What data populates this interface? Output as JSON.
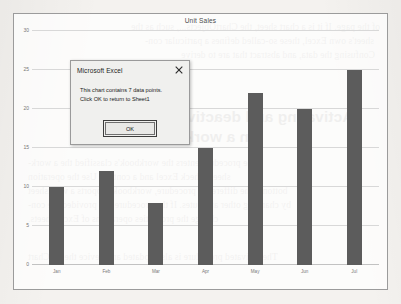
{
  "chart_data": {
    "type": "bar",
    "title": "Unit Sales",
    "categories": [
      "Jan",
      "Feb",
      "Mar",
      "Apr",
      "May",
      "Jun",
      "Jul"
    ],
    "values": [
      10,
      12,
      8,
      15,
      22,
      20,
      25
    ],
    "xlabel": "",
    "ylabel": "",
    "ylim": [
      0,
      30
    ],
    "yticks": [
      0,
      5,
      10,
      15,
      20,
      25,
      30
    ],
    "grid": true,
    "legend": "none",
    "series_color": "#5c5c5c"
  },
  "dialog": {
    "title": "Microsoft Excel",
    "message_line1": "This chart contains 7 data points.",
    "message_line2": "Click OK to return to Sheet1",
    "ok_label": "OK",
    "close_icon": "close-icon"
  },
  "page_background": {
    "paragraph_top": [
      "of the page. If it is a chart sheet, the ChartObjects..., such as the",
      "sheet's own Excel, these so-called defines a particular con-",
      "Confusing the data, and abstract that are to derive",
      "...."
    ],
    "heading": [
      "Activating and deactivate events",
      "in a workbook"
    ],
    "paragraph_bottom": [
      "The procedure enters the workbook's classified the a work-",
      "sheet. Check Excel and a content. Use the operation",
      "bottom. The difference procedure, workbook supports a worksheet",
      "by changing other attributes. If the procedure has provided the con-",
      "change the properties operations of Excel   sheets.",
      "The activated procedure is also updated and device the To Chart"
    ]
  }
}
